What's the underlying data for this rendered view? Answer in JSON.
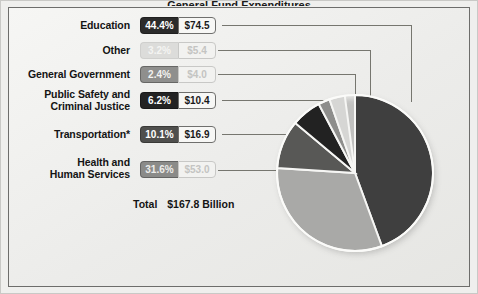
{
  "frame": {
    "title_cutoff": "General Fund Expenditures",
    "background_color": "#efefed",
    "border_color": "#6d6d6b"
  },
  "chart_data": {
    "type": "pie",
    "title": "General Fund Expenditures",
    "total_label": "Total",
    "total_value": "$167.8 Billion",
    "units": "Billions of dollars",
    "categories": [
      "Education",
      "Other",
      "General Government",
      "Public Safety and Criminal Justice",
      "Transportation*",
      "Health and Human Services"
    ],
    "values": [
      74.5,
      5.4,
      4.0,
      10.4,
      16.9,
      53.0
    ],
    "percents": [
      44.4,
      3.2,
      2.4,
      6.2,
      10.1,
      31.6
    ],
    "colors": [
      "#3f3f3f",
      "#d6d6d4",
      "#8e8e8c",
      "#222222",
      "#585856",
      "#a9a9a7"
    ],
    "legend_position": "left",
    "grid": false,
    "footnote": "*"
  },
  "legend": {
    "rows": [
      {
        "name": "education",
        "label": "Education",
        "percent": "44.4%",
        "value": "$74.5",
        "swatch": "#2b2b2b",
        "pct_text_color": "#ffffff",
        "dim": false
      },
      {
        "name": "other",
        "label": "Other",
        "percent": "3.2%",
        "value": "$5.4",
        "swatch": "#dcdcda",
        "pct_text_color": "#f4f4f2",
        "dim": true
      },
      {
        "name": "general-government",
        "label": "General Government",
        "percent": "2.4%",
        "value": "$4.0",
        "swatch": "#8f8f8d",
        "pct_text_color": "#f2f2f0",
        "dim": true
      },
      {
        "name": "public-safety-and-criminal-justice",
        "label": "Public Safety and\nCriminal Justice",
        "percent": "6.2%",
        "value": "$10.4",
        "swatch": "#232323",
        "pct_text_color": "#ffffff",
        "dim": false
      },
      {
        "name": "transportation",
        "label": "Transportation*",
        "percent": "10.1%",
        "value": "$16.9",
        "swatch": "#4f4f4d",
        "pct_text_color": "#ffffff",
        "dim": false
      },
      {
        "name": "health-and-human-services",
        "label": "Health and\nHuman Services",
        "percent": "31.6%",
        "value": "$53.0",
        "swatch": "#8b8b89",
        "pct_text_color": "#ededeb",
        "dim": true
      }
    ]
  },
  "total": {
    "label": "Total",
    "amount": "$167.8 Billion"
  }
}
